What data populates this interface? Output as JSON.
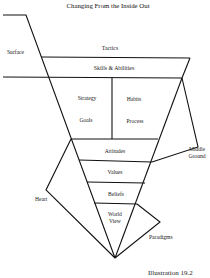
{
  "title": "Changing From the Inside Out",
  "caption": "Illustration 19.2",
  "layers": {
    "tactics": "Tactics",
    "skills": "Skills & Abilities",
    "strategy": "Strategy",
    "goals": "Goals",
    "habits": "Habits",
    "process": "Process",
    "attitudes": "Attitudes",
    "values": "Values",
    "beliefs": "Beliefs",
    "world_view_1": "World",
    "world_view_2": "View"
  },
  "side_labels": {
    "surface": "Surface",
    "middle_ground_1": "Middle",
    "middle_ground_2": "Ground",
    "heart": "Heart",
    "paradigms": "Paradigms"
  },
  "colors": {
    "line": "#111111",
    "background": "#ffffff"
  }
}
